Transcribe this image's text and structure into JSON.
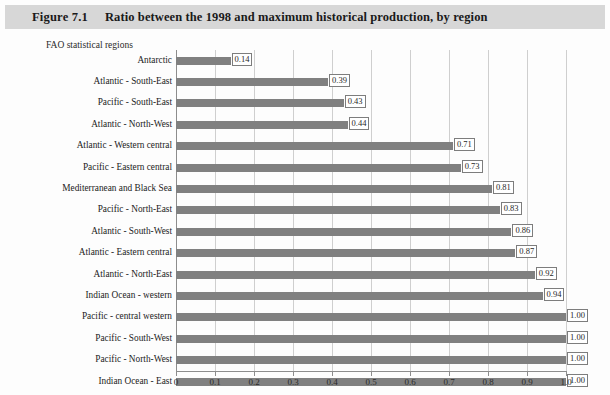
{
  "figure": {
    "number": "Figure 7.1",
    "title": "Ratio between the 1998 and maximum historical production, by region"
  },
  "chart_data": {
    "type": "bar",
    "orientation": "horizontal",
    "title": "Ratio between the 1998 and maximum historical production, by region",
    "xlabel": "",
    "ylabel": "FAO statistical regions",
    "xlim": [
      0,
      1.0
    ],
    "grid": true,
    "legend": false,
    "xticks": [
      "0",
      "0.1",
      "0.2",
      "0.3",
      "0.4",
      "0.5",
      "0.6",
      "0.7",
      "0.8",
      "0.9",
      "1.0"
    ],
    "xtick_values": [
      0,
      0.1,
      0.2,
      0.3,
      0.4,
      0.5,
      0.6,
      0.7,
      0.8,
      0.9,
      1.0
    ],
    "bar_color": "#808080",
    "categories": [
      "Antarctic",
      "Atlantic - South-East",
      "Pacific - South-East",
      "Atlantic - North-West",
      "Atlantic - Western central",
      "Pacific - Eastern central",
      "Mediterranean and Black Sea",
      "Pacific - North-East",
      "Atlantic - South-West",
      "Atlantic - Eastern central",
      "Atlantic - North-East",
      "Indian Ocean - western",
      "Pacific - central western",
      "Pacific - South-West",
      "Pacific - North-West",
      "Indian Ocean - East"
    ],
    "values": [
      0.14,
      0.39,
      0.43,
      0.44,
      0.71,
      0.73,
      0.81,
      0.83,
      0.86,
      0.87,
      0.92,
      0.94,
      1.0,
      1.0,
      1.0,
      1.0
    ],
    "value_labels": [
      "0.14",
      "0.39",
      "0.43",
      "0.44",
      "0.71",
      "0.73",
      "0.81",
      "0.83",
      "0.86",
      "0.87",
      "0.92",
      "0.94",
      "1.00",
      "1.00",
      "1.00",
      "1.00"
    ]
  }
}
